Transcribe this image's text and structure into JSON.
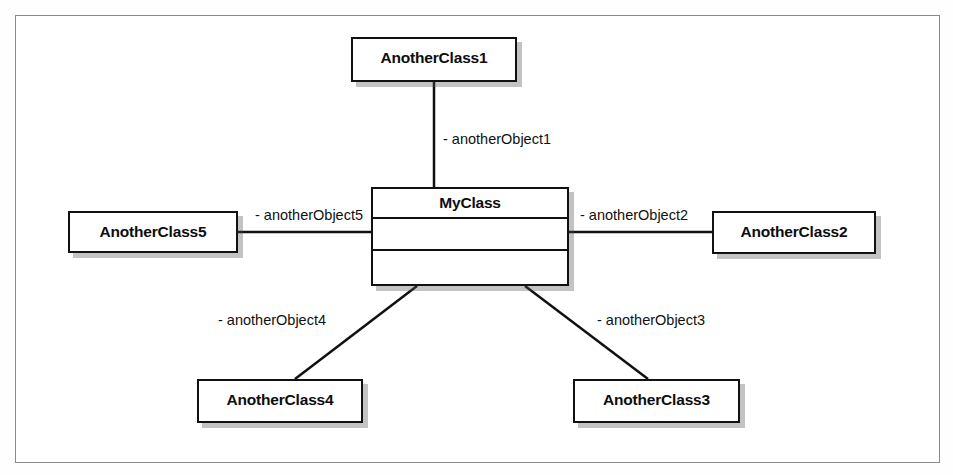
{
  "figure": {
    "kind": "uml-class-diagram",
    "frame_border_color": "#8a8a8a",
    "line_color": "#111111",
    "box_fill": "#ffffff"
  },
  "central_class": {
    "name": "MyClass",
    "compartments": [
      "MyClass",
      "",
      ""
    ],
    "attributes_text": "",
    "operations_text": ""
  },
  "classes": [
    {
      "id": "another1",
      "name": "AnotherClass1",
      "position": "top"
    },
    {
      "id": "another2",
      "name": "AnotherClass2",
      "position": "right"
    },
    {
      "id": "another3",
      "name": "AnotherClass3",
      "position": "bottom-right"
    },
    {
      "id": "another4",
      "name": "AnotherClass4",
      "position": "bottom-left"
    },
    {
      "id": "another5",
      "name": "AnotherClass5",
      "position": "left"
    }
  ],
  "associations": [
    {
      "id": "obj1",
      "role_label": "- anotherObject1",
      "from": "MyClass",
      "to": "AnotherClass1"
    },
    {
      "id": "obj2",
      "role_label": "- anotherObject2",
      "from": "MyClass",
      "to": "AnotherClass2"
    },
    {
      "id": "obj3",
      "role_label": "- anotherObject3",
      "from": "MyClass",
      "to": "AnotherClass3"
    },
    {
      "id": "obj4",
      "role_label": "- anotherObject4",
      "from": "MyClass",
      "to": "AnotherClass4"
    },
    {
      "id": "obj5",
      "role_label": "- anotherObject5",
      "from": "MyClass",
      "to": "AnotherClass5"
    }
  ]
}
